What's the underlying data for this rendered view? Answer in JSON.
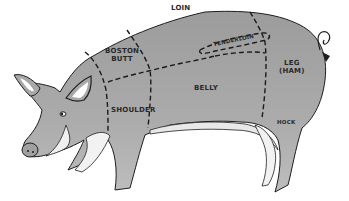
{
  "diagram": {
    "colors": {
      "body": "#a9a9a9",
      "outline": "#1e1e1e",
      "cut_lines": "#1a1a1a",
      "highlight": "#ffffff",
      "background": "#ffffff"
    },
    "cuts": [
      {
        "id": "loin",
        "label": "LOIN"
      },
      {
        "id": "boston-butt",
        "label_line1": "BOSTON",
        "label_line2": "BUTT"
      },
      {
        "id": "tenderloin",
        "label": "TENDERLOIN"
      },
      {
        "id": "leg-ham",
        "label_line1": "LEG",
        "label_line2": "(HAM)"
      },
      {
        "id": "belly",
        "label": "BELLY"
      },
      {
        "id": "shoulder",
        "label": "SHOULDER"
      },
      {
        "id": "hock",
        "label": "HOCK"
      }
    ]
  }
}
